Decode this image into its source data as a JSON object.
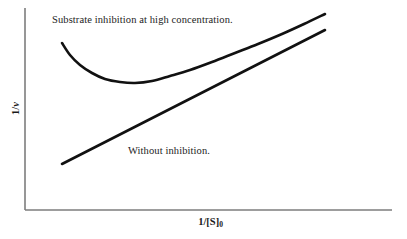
{
  "figure": {
    "background_color": "#ffffff",
    "width": 407,
    "height": 239
  },
  "axes": {
    "line_color": "#7d7d7d",
    "x_axis": {
      "name": "x-axis",
      "title_prefix": "1/[S]",
      "title_subscript": "0",
      "title_full": "1/[S]0",
      "x_start": 25,
      "x_end": 392,
      "y": 210
    },
    "y_axis": {
      "name": "y-axis",
      "title_prefix": "1/",
      "title_italic": "v",
      "title_full": "1/v",
      "y_start": 8,
      "y_end": 210,
      "x": 25
    }
  },
  "annotations": [
    {
      "id": "substrate-inhibition",
      "text": "Substrate inhibition at high concentration.",
      "x": 52,
      "y": 14
    },
    {
      "id": "without-inhibition",
      "text": "Without inhibition.",
      "x": 128,
      "y": 145
    }
  ],
  "chart_data": {
    "type": "line",
    "title": "",
    "xlabel": "1/[S]0",
    "ylabel": "1/v",
    "grid": false,
    "legend_position": "inline-annotation",
    "axis_direction_note": "1/v increases upward; 1/[S]0 increases rightward",
    "xlim": [
      25,
      392
    ],
    "ylim_pixels_top_bottom": [
      8,
      210
    ],
    "stroke_color": "#111111",
    "stroke_width": 2.6,
    "series": [
      {
        "name": "Substrate inhibition at high concentration.",
        "description": "U-shaped curve: falls from a high left intercept to a minimum, then rises steeply at high 1/[S]0",
        "points_px": [
          [
            62,
            43
          ],
          [
            70,
            55
          ],
          [
            80,
            65
          ],
          [
            92,
            73
          ],
          [
            105,
            79
          ],
          [
            120,
            82
          ],
          [
            135,
            83
          ],
          [
            152,
            81
          ],
          [
            170,
            76
          ],
          [
            190,
            70
          ],
          [
            212,
            62
          ],
          [
            235,
            53
          ],
          [
            258,
            44
          ],
          [
            282,
            34
          ],
          [
            304,
            24
          ],
          [
            325,
            14
          ]
        ],
        "minimum_px": [
          130,
          83
        ]
      },
      {
        "name": "Without inhibition.",
        "description": "Straight Lineweaver-Burk line with positive slope",
        "points_px": [
          [
            62,
            164
          ],
          [
            325,
            30
          ]
        ],
        "slope_px": -0.509
      }
    ]
  }
}
